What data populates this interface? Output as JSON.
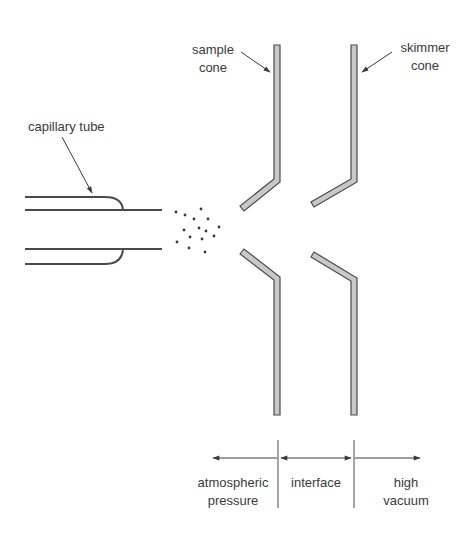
{
  "diagram": {
    "labels": {
      "capillary_tube": "capillary tube",
      "sample_cone_line1": "sample",
      "sample_cone_line2": "cone",
      "skimmer_cone_line1": "skimmer",
      "skimmer_cone_line2": "cone"
    },
    "regions": [
      {
        "line1": "atmospheric",
        "line2": "pressure"
      },
      {
        "line1": "interface",
        "line2": ""
      },
      {
        "line1": "high",
        "line2": "vacuum"
      }
    ],
    "colors": {
      "line": "#4a4a4a",
      "cone_fill": "#c8c8c8",
      "text": "#3a3a3a"
    }
  }
}
